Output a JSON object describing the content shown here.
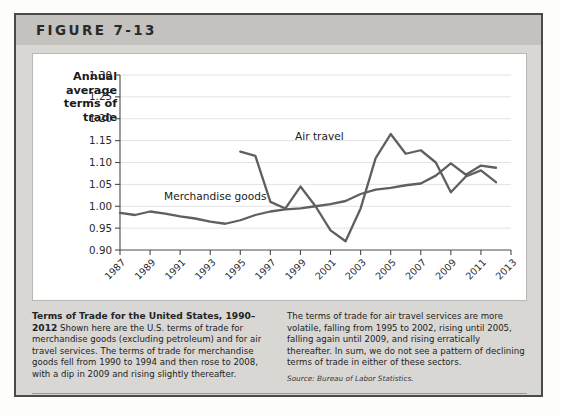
{
  "figure": {
    "number_label": "FIGURE 7-13"
  },
  "axis": {
    "ylabel": "Annual average terms of trade",
    "yticks": [
      "1.30",
      "1.25",
      "1.20",
      "1.15",
      "1.10",
      "1.05",
      "1.00",
      "0.95",
      "0.90"
    ],
    "xticks": [
      "1987",
      "1989",
      "1991",
      "1993",
      "1995",
      "1997",
      "1999",
      "2001",
      "2003",
      "2005",
      "2007",
      "2009",
      "2011",
      "2013"
    ]
  },
  "series_labels": {
    "air": "Air travel",
    "merch": "Merchandise goods"
  },
  "caption": {
    "title": "Terms of Trade for the United States, 1990–2012",
    "left_body": " Shown here are the U.S. terms of trade for merchandise goods (excluding petroleum) and for air travel services. The terms of trade for merchandise goods fell from 1990 to 1994 and then rose to 2008, with a dip in 2009 and rising slightly thereafter.",
    "right_body": "The terms of trade for air travel services are more volatile, falling from 1995 to 2002, rising until 2005, falling again until 2009, and rising erratically thereafter. In sum, we do not see a pattern of declining terms of trade in either of these sectors.",
    "source": "Source: Bureau of Labor Statistics."
  },
  "colors": {
    "line": "#5f5f5f",
    "grid": "#e2e2e2",
    "axis": "#4a4a4a",
    "panel": "#ffffff"
  },
  "chart_data": {
    "type": "line",
    "title": "Terms of Trade for the United States, 1990–2012",
    "xlabel": "",
    "ylabel": "Annual average terms of trade",
    "xlim": [
      1987,
      2013
    ],
    "ylim": [
      0.9,
      1.3
    ],
    "ytick_step": 0.05,
    "xtick_step": 2,
    "grid": true,
    "legend": "inline-labels",
    "series": [
      {
        "name": "Merchandise goods",
        "x": [
          1987,
          1988,
          1989,
          1990,
          1991,
          1992,
          1993,
          1994,
          1995,
          1996,
          1997,
          1998,
          1999,
          2000,
          2001,
          2002,
          2003,
          2004,
          2005,
          2006,
          2007,
          2008,
          2009,
          2010,
          2011,
          2012
        ],
        "values": [
          0.985,
          0.98,
          0.988,
          0.983,
          0.977,
          0.972,
          0.965,
          0.96,
          0.968,
          0.98,
          0.988,
          0.993,
          0.995,
          1.0,
          1.005,
          1.012,
          1.028,
          1.038,
          1.042,
          1.048,
          1.052,
          1.07,
          1.098,
          1.072,
          1.093,
          1.088
        ]
      },
      {
        "name": "Air travel",
        "x": [
          1995,
          1996,
          1997,
          1998,
          1999,
          2000,
          2001,
          2002,
          2003,
          2004,
          2005,
          2006,
          2007,
          2008,
          2009,
          2010,
          2011,
          2012
        ],
        "values": [
          1.125,
          1.115,
          1.01,
          0.995,
          1.045,
          1.0,
          0.945,
          0.92,
          0.995,
          1.11,
          1.165,
          1.12,
          1.128,
          1.1,
          1.032,
          1.068,
          1.082,
          1.055
        ]
      }
    ]
  }
}
